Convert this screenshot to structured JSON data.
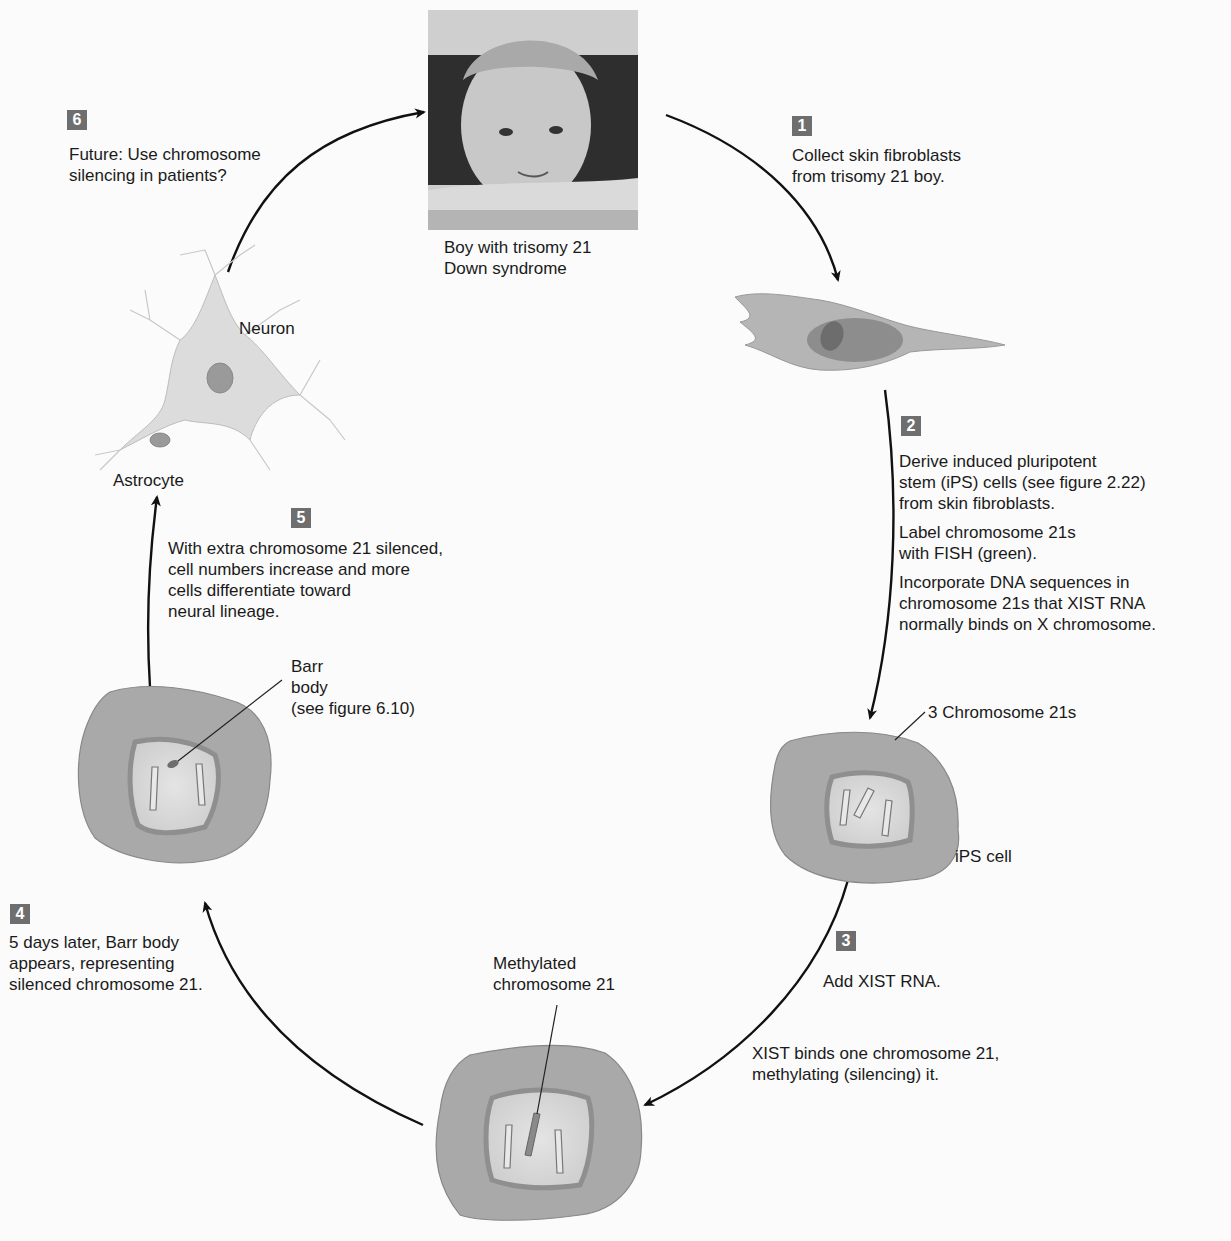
{
  "figure": {
    "type": "cycle-diagram",
    "topic": "Chromosome 21 silencing with XIST RNA in trisomy 21 iPS cells",
    "colors": {
      "badge_bg": "#6e6e6e",
      "cell_cytoplasm": "#a9a9a9",
      "nucleus_rim": "#8f8f8f",
      "nucleus_inner": "#d6d6d6",
      "arrow": "#111111",
      "background": "#fbfbfb"
    }
  },
  "photo": {
    "caption_line1": "Boy with trisomy 21",
    "caption_line2": "Down syndrome"
  },
  "steps": [
    {
      "number": "1",
      "lines": [
        "Collect skin fibroblasts",
        "from trisomy 21 boy."
      ]
    },
    {
      "number": "2",
      "paragraphs": [
        [
          "Derive induced pluripotent",
          "stem (iPS) cells (see figure 2.22)",
          "from skin fibroblasts."
        ],
        [
          "Label chromosome 21s",
          "with FISH (green)."
        ],
        [
          "Incorporate DNA sequences in",
          "chromosome 21s that XIST RNA",
          "normally binds on X chromosome."
        ]
      ]
    },
    {
      "number": "3",
      "lines": [
        "Add XIST RNA."
      ],
      "extra": [
        "XIST binds one chromosome 21,",
        "methylating (silencing) it."
      ]
    },
    {
      "number": "4",
      "lines": [
        "5 days later, Barr body",
        "appears, representing",
        "silenced chromosome 21."
      ]
    },
    {
      "number": "5",
      "lines": [
        "With extra chromosome 21 silenced,",
        "cell numbers increase and more",
        "cells differentiate toward",
        "neural lineage."
      ]
    },
    {
      "number": "6",
      "lines": [
        "Future: Use chromosome",
        "silencing in patients?"
      ]
    }
  ],
  "labels": {
    "three_chromosomes": "3 Chromosome 21s",
    "ips_cell": "iPS cell",
    "methylated_line1": "Methylated",
    "methylated_line2": "chromosome 21",
    "barr_line1": "Barr",
    "barr_line2": "body",
    "barr_line3": "(see figure 6.10)",
    "neuron": "Neuron",
    "astrocyte": "Astrocyte"
  }
}
